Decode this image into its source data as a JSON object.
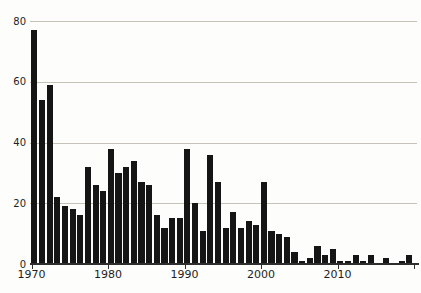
{
  "chart_data": {
    "type": "bar",
    "title": "",
    "xlabel": "",
    "ylabel": "",
    "x": [
      1970,
      1971,
      1972,
      1973,
      1974,
      1975,
      1976,
      1977,
      1978,
      1979,
      1980,
      1981,
      1982,
      1983,
      1984,
      1985,
      1986,
      1987,
      1988,
      1989,
      1990,
      1991,
      1992,
      1993,
      1994,
      1995,
      1996,
      1997,
      1998,
      1999,
      2000,
      2001,
      2002,
      2003,
      2004,
      2005,
      2006,
      2007,
      2008,
      2009,
      2010,
      2011,
      2012,
      2013,
      2014,
      2015,
      2016,
      2017,
      2018,
      2019
    ],
    "values": [
      77,
      54,
      59,
      22,
      19,
      18,
      16,
      32,
      26,
      24,
      38,
      30,
      32,
      34,
      27,
      26,
      16,
      12,
      15,
      15,
      38,
      20,
      11,
      36,
      27,
      12,
      17,
      12,
      14,
      13,
      27,
      11,
      10,
      9,
      4,
      1,
      2,
      6,
      3,
      5,
      1,
      1,
      3,
      1,
      3,
      0,
      2,
      0,
      1,
      3
    ],
    "ylim": [
      0,
      80
    ],
    "ytick_values": [
      0,
      20,
      40,
      60,
      80
    ],
    "ytick_labels": [
      "0",
      "20",
      "40",
      "60",
      "80"
    ],
    "xtick_years": [
      1970,
      1980,
      1990,
      2000,
      2010,
      2020
    ],
    "xtick_labels": [
      "1970",
      "1980",
      "1990",
      "2000",
      "2010",
      ""
    ],
    "grid": "horizontal-only",
    "legend": "none",
    "bar_color": "#151515",
    "gridline_color": "#c6c2b8",
    "axis_color": "#2e2e2e",
    "label_color": "#1f1f1f",
    "background_color": "#fdfdfb"
  }
}
